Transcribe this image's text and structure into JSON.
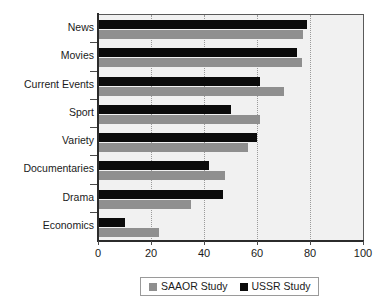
{
  "chart_data": {
    "type": "bar",
    "orientation": "horizontal",
    "title": "",
    "xlabel": "",
    "ylabel": "",
    "xlim": [
      0,
      100
    ],
    "xticks": [
      0,
      20,
      40,
      60,
      80,
      100
    ],
    "grid": "vertical-dotted",
    "legend_position": "bottom-center",
    "categories": [
      "News",
      "Movies",
      "Current Events",
      "Sport",
      "Variety",
      "Documentaries",
      "Drama",
      "Economics"
    ],
    "series": [
      {
        "name": "SAAOR Study",
        "color": "#8f8f8f",
        "values": [
          77.5,
          77,
          70,
          61,
          56.5,
          48,
          35,
          23
        ]
      },
      {
        "name": "USSR Study",
        "color": "#0b0b0b",
        "values": [
          79,
          75,
          61,
          50,
          60,
          42,
          47,
          10
        ]
      }
    ]
  },
  "legend": {
    "entries": [
      {
        "label": "SAAOR Study",
        "swatch": "gray-swatch-icon"
      },
      {
        "label": "USSR Study",
        "swatch": "black-swatch-icon"
      }
    ]
  },
  "axis": {
    "x_tick_labels": [
      "0",
      "20",
      "40",
      "60",
      "80",
      "100"
    ]
  },
  "colors": {
    "plot_background": "#f1f1f1",
    "axis": "#2b2b2b",
    "gridline": "#9a9a9a",
    "series_saaor": "#8f8f8f",
    "series_ussr": "#0b0b0b"
  }
}
